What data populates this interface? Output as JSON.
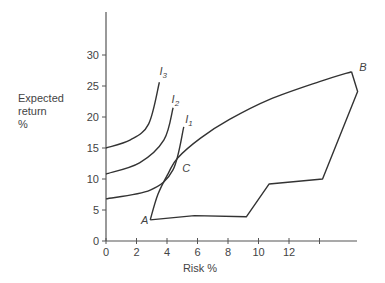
{
  "chart_data": {
    "type": "line",
    "title": "",
    "xlabel": "Risk %",
    "ylabel_lines": [
      "Expected",
      "return",
      "%"
    ],
    "ylabel": "Expected return %",
    "xlim": [
      0,
      16.5
    ],
    "ylim": [
      0,
      35
    ],
    "x_ticks": [
      0,
      2,
      4,
      6,
      8,
      10,
      12,
      14
    ],
    "x_tick_labels": [
      "0",
      "2",
      "4",
      "6",
      "8",
      "10",
      "12",
      ""
    ],
    "y_ticks": [
      0,
      5,
      10,
      15,
      20,
      25,
      30
    ],
    "y_tick_labels": [
      "0",
      "5",
      "10",
      "15",
      "20",
      "25",
      "30"
    ],
    "grid": false,
    "legend": "none",
    "series": [
      {
        "name": "Opportunity set (upper boundary A-C-B)",
        "points": [
          [
            2.9,
            3.4
          ],
          [
            3.4,
            7.5
          ],
          [
            4.1,
            11.0
          ],
          [
            4.7,
            13.4
          ],
          [
            6.2,
            16.6
          ],
          [
            8.1,
            19.6
          ],
          [
            10.7,
            22.8
          ],
          [
            14.0,
            25.7
          ],
          [
            16.1,
            27.3
          ]
        ]
      },
      {
        "name": "Opportunity set (lower boundary A-B)",
        "points": [
          [
            2.9,
            3.4
          ],
          [
            5.8,
            4.1
          ],
          [
            9.2,
            3.9
          ],
          [
            10.7,
            9.2
          ],
          [
            14.2,
            10.0
          ],
          [
            16.5,
            24.1
          ],
          [
            16.1,
            27.3
          ]
        ]
      },
      {
        "name": "I1",
        "points": [
          [
            0,
            6.8
          ],
          [
            2.9,
            8.2
          ],
          [
            4.4,
            11.5
          ],
          [
            5.1,
            18.4
          ]
        ]
      },
      {
        "name": "I2",
        "points": [
          [
            0,
            10.8
          ],
          [
            2.2,
            12.6
          ],
          [
            3.8,
            16.3
          ],
          [
            4.4,
            21.5
          ]
        ]
      },
      {
        "name": "I3",
        "points": [
          [
            0,
            15.0
          ],
          [
            1.6,
            16.3
          ],
          [
            2.8,
            18.9
          ],
          [
            3.5,
            25.6
          ]
        ]
      }
    ],
    "annotations": [
      {
        "text": "A",
        "x": 2.3,
        "y": 2.8
      },
      {
        "text": "B",
        "x": 16.6,
        "y": 27.5
      },
      {
        "text": "C",
        "x": 5.0,
        "y": 11.2
      },
      {
        "text": "I",
        "sub": "1",
        "x": 5.2,
        "y": 19.0
      },
      {
        "text": "I",
        "sub": "2",
        "x": 4.3,
        "y": 22.3
      },
      {
        "text": "I",
        "sub": "3",
        "x": 3.5,
        "y": 26.8
      }
    ],
    "colors": {
      "axis": "#555555",
      "line": "#333333",
      "text": "#444444"
    }
  }
}
